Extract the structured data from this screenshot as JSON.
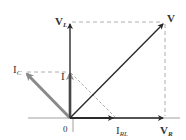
{
  "diagram": {
    "origin_label": "0",
    "colors": {
      "dark_vector": "#2a2a2a",
      "gray_vector": "#8a8a8a",
      "dashed": "#9a9a9a",
      "axis": "#9a9a9a",
      "text": "#333333"
    },
    "vectors": [
      {
        "name": "V_L",
        "label_main": "V",
        "label_sub": "L",
        "from": [
          70,
          118
        ],
        "to": [
          70,
          22
        ],
        "style": "dark"
      },
      {
        "name": "V",
        "label_main": "V",
        "label_sub": "",
        "from": [
          70,
          118
        ],
        "to": [
          165,
          22
        ],
        "style": "dark"
      },
      {
        "name": "V_R",
        "label_main": "V",
        "label_sub": "R",
        "from": [
          70,
          118
        ],
        "to": [
          165,
          118
        ],
        "style": "dark"
      },
      {
        "name": "I_RL",
        "label_main": "I",
        "label_sub": "RL",
        "from": [
          70,
          118
        ],
        "to": [
          115,
          118
        ],
        "style": "dark"
      },
      {
        "name": "I_C",
        "label_main": "I",
        "label_sub": "C",
        "from": [
          70,
          118
        ],
        "to": [
          25,
          72
        ],
        "style": "gray"
      },
      {
        "name": "I",
        "label_main": "I",
        "label_sub": "",
        "from": [
          70,
          118
        ],
        "to": [
          70,
          72
        ],
        "style": "gray"
      }
    ],
    "labels": {
      "v_l": {
        "main": "V",
        "sub": "L"
      },
      "v": {
        "main": "V"
      },
      "v_r": {
        "main": "V",
        "sub": "R"
      },
      "i_rl": {
        "main": "I",
        "sub": "RL"
      },
      "i_c": {
        "main": "I",
        "sub": "C"
      },
      "i": {
        "main": "I"
      },
      "origin": "0"
    },
    "dashed_lines": [
      {
        "from": "V_L",
        "to": "V",
        "orientation": "horizontal"
      },
      {
        "from": "V",
        "to": "V_R",
        "orientation": "vertical"
      },
      {
        "from": "I_C",
        "to": "I",
        "orientation": "horizontal"
      },
      {
        "from": "I",
        "to": "I_RL",
        "orientation": "diagonal"
      }
    ]
  }
}
